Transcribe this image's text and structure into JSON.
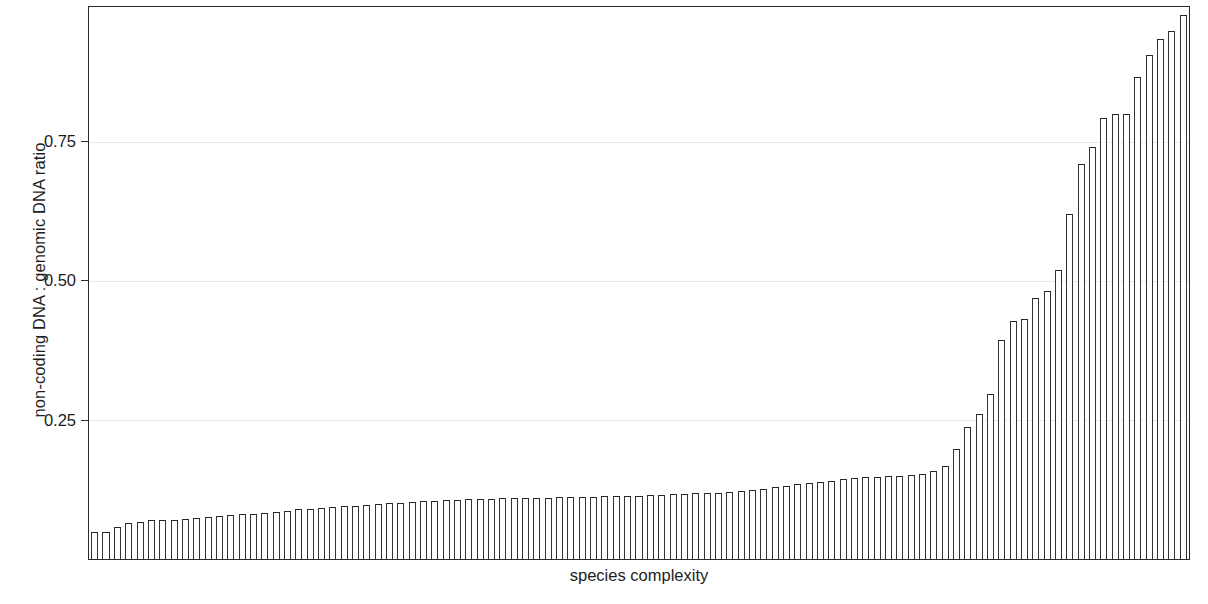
{
  "chart_data": {
    "type": "bar",
    "title": "",
    "subtitle": "",
    "xlabel": "species complexity",
    "ylabel": "non-coding DNA : genomic DNA ratio",
    "legend": [],
    "legend_position": "none",
    "grid": true,
    "grid_axis": "y",
    "xlim": [
      0,
      94
    ],
    "ylim": [
      0,
      0.992
    ],
    "ytick_labels": [
      "0.25",
      "0.50",
      "0.75"
    ],
    "ytick_values": [
      0.25,
      0.5,
      0.75
    ],
    "xtick_labels": [],
    "x_axis_ticks_visible": false,
    "n_bars": 94,
    "bar_style": {
      "fill": "#ffffff",
      "edge": "#2e2e2e",
      "edge_width_px": 1
    },
    "axis_color": "#2b2b2b",
    "gridline_color": "#e8e8e8",
    "background": "#ffffff",
    "categories": [
      "1",
      "2",
      "3",
      "4",
      "5",
      "6",
      "7",
      "8",
      "9",
      "10",
      "11",
      "12",
      "13",
      "14",
      "15",
      "16",
      "17",
      "18",
      "19",
      "20",
      "21",
      "22",
      "23",
      "24",
      "25",
      "26",
      "27",
      "28",
      "29",
      "30",
      "31",
      "32",
      "33",
      "34",
      "35",
      "36",
      "37",
      "38",
      "39",
      "40",
      "41",
      "42",
      "43",
      "44",
      "45",
      "46",
      "47",
      "48",
      "49",
      "50",
      "51",
      "52",
      "53",
      "54",
      "55",
      "56",
      "57",
      "58",
      "59",
      "60",
      "61",
      "62",
      "63",
      "64",
      "65",
      "66",
      "67",
      "68",
      "69",
      "70",
      "71",
      "72",
      "73",
      "74",
      "75",
      "76",
      "77",
      "78",
      "79",
      "80",
      "81",
      "82",
      "83",
      "84",
      "85",
      "86",
      "87",
      "88",
      "89",
      "90",
      "91",
      "92",
      "93",
      "94"
    ],
    "values": [
      0.048,
      0.048,
      0.058,
      0.064,
      0.066,
      0.07,
      0.07,
      0.07,
      0.072,
      0.074,
      0.076,
      0.078,
      0.079,
      0.08,
      0.081,
      0.083,
      0.084,
      0.086,
      0.089,
      0.09,
      0.092,
      0.093,
      0.095,
      0.096,
      0.097,
      0.099,
      0.1,
      0.101,
      0.103,
      0.104,
      0.105,
      0.106,
      0.106,
      0.107,
      0.108,
      0.108,
      0.109,
      0.109,
      0.11,
      0.11,
      0.11,
      0.111,
      0.111,
      0.112,
      0.112,
      0.113,
      0.113,
      0.114,
      0.114,
      0.115,
      0.115,
      0.116,
      0.117,
      0.118,
      0.118,
      0.119,
      0.12,
      0.122,
      0.124,
      0.126,
      0.129,
      0.131,
      0.134,
      0.136,
      0.139,
      0.141,
      0.143,
      0.145,
      0.147,
      0.148,
      0.149,
      0.15,
      0.151,
      0.153,
      0.158,
      0.168,
      0.198,
      0.237,
      0.26,
      0.296,
      0.393,
      0.428,
      0.432,
      0.469,
      0.481,
      0.52,
      0.62,
      0.71,
      0.74,
      0.792,
      0.8,
      0.8,
      0.866,
      0.905
    ],
    "values_tail_extra": [
      0.935,
      0.948,
      0.978
    ]
  },
  "axis": {
    "ylabel": "non-coding DNA : genomic DNA ratio",
    "xlabel": "species complexity",
    "ytick_0": "0.25",
    "ytick_1": "0.50",
    "ytick_2": "0.75"
  }
}
